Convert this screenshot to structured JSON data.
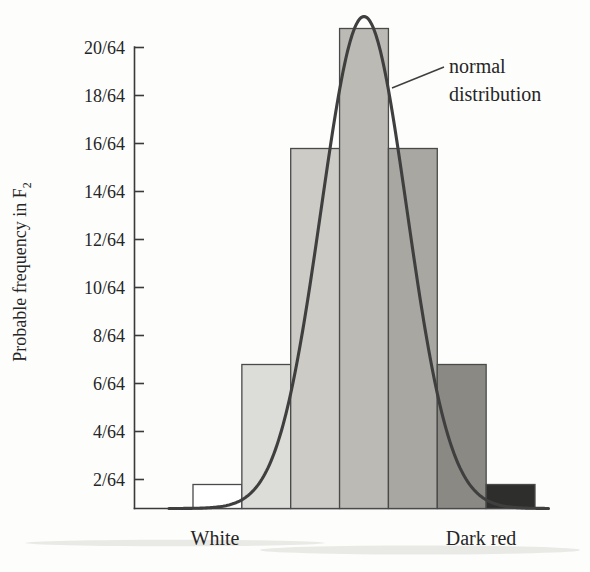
{
  "chart_data": {
    "type": "bar",
    "title": "",
    "xlabel": "",
    "ylabel": "Probable frequency in F",
    "ylabel_subscript": "2",
    "categories": [
      "1",
      "2",
      "3",
      "4",
      "5",
      "6",
      "7"
    ],
    "values": [
      1,
      6,
      15,
      20,
      15,
      6,
      1
    ],
    "value_labels": [
      "1/64",
      "6/64",
      "15/64",
      "20/64",
      "15/64",
      "6/64",
      "1/64"
    ],
    "ylim": [
      0,
      21
    ],
    "ytick_values": [
      2,
      4,
      6,
      8,
      10,
      12,
      14,
      16,
      18,
      20
    ],
    "ytick_labels": [
      "2/64",
      "4/64",
      "6/64",
      "8/64",
      "10/64",
      "12/64",
      "14/64",
      "16/64",
      "18/64",
      "20/64"
    ],
    "grid": false,
    "legend": null,
    "bar_colors": [
      "#ffffff",
      "#dcdcd8",
      "#cccbc6",
      "#bbbab4",
      "#a8a7a1",
      "#8a8984",
      "#2e2e2c"
    ],
    "bar_edge_color": "#4a4a4a",
    "x_category_labels": [
      {
        "text": "White",
        "position": "left"
      },
      {
        "text": "Dark red",
        "position": "right"
      }
    ],
    "annotations": [
      {
        "name": "normal-distribution",
        "line1": "normal",
        "line2": "distribution",
        "points_to": "overlay normal distribution curve"
      }
    ],
    "overlay_curve": {
      "name": "normal distribution",
      "type": "line",
      "color": "#3f3f3f",
      "peak_value": 20.5,
      "mean_category": 4
    }
  },
  "axis": {
    "y_axis_color": "#3a3a3a",
    "x_axis_color": "#3a3a3a"
  }
}
